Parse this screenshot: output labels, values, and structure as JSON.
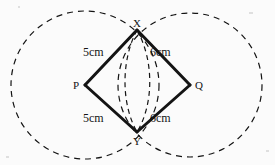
{
  "figure": {
    "background_color": "#fbfbfb",
    "stroke_color": "#141414",
    "solid_stroke_width": 3,
    "dashed_stroke_width": 1.2,
    "dash_pattern": "6 5",
    "lens_dash_pattern": "5 4"
  },
  "vertices": [
    {
      "id": "vertex-x",
      "label": "X",
      "x": 137,
      "y": 30,
      "label_x": 133,
      "label_y": 18
    },
    {
      "id": "vertex-p",
      "label": "P",
      "x": 85,
      "y": 85,
      "label_x": 73,
      "label_y": 80
    },
    {
      "id": "vertex-q",
      "label": "Q",
      "x": 190,
      "y": 85,
      "label_x": 195,
      "label_y": 80
    },
    {
      "id": "vertex-y",
      "label": "Y",
      "x": 137,
      "y": 132,
      "label_x": 133,
      "label_y": 136
    }
  ],
  "edges": [
    {
      "id": "edge-px",
      "from": "P",
      "to": "X",
      "length": "5cm",
      "label_x": 83,
      "label_y": 46
    },
    {
      "id": "edge-xq",
      "from": "X",
      "to": "Q",
      "length": "6cm",
      "label_x": 150,
      "label_y": 46
    },
    {
      "id": "edge-py",
      "from": "P",
      "to": "Y",
      "length": "5cm",
      "label_x": 83,
      "label_y": 112
    },
    {
      "id": "edge-yq",
      "from": "Y",
      "to": "Q",
      "length": "6cm",
      "label_x": 150,
      "label_y": 112
    }
  ],
  "circles": [
    {
      "id": "circle-p",
      "center_label": "P",
      "cx": 85,
      "cy": 85,
      "r": 74,
      "radius_length": "5cm"
    },
    {
      "id": "circle-q",
      "center_label": "Q",
      "cx": 190,
      "cy": 85,
      "r": 72,
      "radius_length": "6cm"
    }
  ],
  "lens": {
    "id": "lens-xy",
    "description": "vesica formed by the two arcs between X and Y",
    "left_arc": "M 137 30 C 121 60, 121 104, 137 132",
    "right_arc": "M 137 30 C 154 60, 154 104, 137 132"
  },
  "specks": [
    {
      "x": 6,
      "y": 156,
      "w": 3,
      "h": 2
    },
    {
      "x": 249,
      "y": 12,
      "w": 4,
      "h": 2
    },
    {
      "x": 266,
      "y": 150,
      "w": 3,
      "h": 2
    },
    {
      "x": 18,
      "y": 6,
      "w": 2,
      "h": 2
    }
  ]
}
